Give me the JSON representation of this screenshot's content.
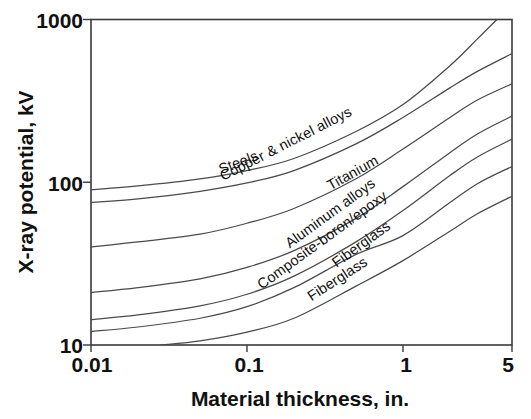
{
  "chart_data": {
    "type": "line",
    "title": "",
    "xlabel": "Material thickness, in.",
    "ylabel": "X-ray potential, kV",
    "xscale": "log",
    "yscale": "log",
    "xlim": [
      0.01,
      5
    ],
    "ylim": [
      10,
      1000
    ],
    "grid": false,
    "legend_position": "inline-on-curve",
    "xticks": [
      "0.01",
      "0.1",
      "1",
      "5"
    ],
    "xtick_values": [
      0.01,
      0.1,
      1,
      5
    ],
    "yticks": [
      "10",
      "100",
      "1000"
    ],
    "ytick_values": [
      10,
      100,
      1000
    ],
    "series": [
      {
        "name": "Copper & nickel alloys",
        "label": "Copper & nickel alloys",
        "x": [
          0.01,
          0.02,
          0.05,
          0.1,
          0.2,
          0.5,
          1.0,
          2.0,
          3.0,
          4.0
        ],
        "y": [
          90,
          95,
          105,
          118,
          140,
          205,
          300,
          520,
          760,
          1000
        ]
      },
      {
        "name": "Steels",
        "label": "Steels",
        "x": [
          0.01,
          0.02,
          0.05,
          0.1,
          0.2,
          0.5,
          1.0,
          2.0,
          3.0,
          5.0
        ],
        "y": [
          75,
          79,
          88,
          99,
          118,
          172,
          250,
          380,
          480,
          617
        ]
      },
      {
        "name": "Titanium",
        "label": "Titanium",
        "x": [
          0.01,
          0.02,
          0.05,
          0.1,
          0.2,
          0.5,
          1.0,
          2.0,
          3.0,
          5.0
        ],
        "y": [
          40,
          43,
          48,
          56,
          69,
          105,
          160,
          250,
          320,
          403
        ]
      },
      {
        "name": "Aluminum alloys",
        "label": "Aluminum alloys",
        "x": [
          0.01,
          0.02,
          0.05,
          0.1,
          0.2,
          0.5,
          1.0,
          2.0,
          3.0,
          5.0
        ],
        "y": [
          21,
          22.5,
          25.5,
          30,
          38,
          60,
          94,
          152,
          198,
          255
        ]
      },
      {
        "name": "Composite-boron/epoxy",
        "label": "Composite-boron/epoxy",
        "x": [
          0.01,
          0.02,
          0.05,
          0.1,
          0.2,
          0.5,
          1.0,
          2.0,
          3.0,
          5.0
        ],
        "y": [
          14.3,
          15.3,
          17.4,
          20.5,
          26.5,
          43,
          67,
          110,
          143,
          184
        ]
      },
      {
        "name": "Fiberglass (upper)",
        "label": "Fiberglass",
        "x": [
          0.01,
          0.02,
          0.05,
          0.1,
          0.2,
          0.5,
          1.0,
          2.0,
          3.0,
          5.0
        ],
        "y": [
          12.1,
          12.9,
          14.6,
          17.2,
          22.5,
          36,
          47,
          75,
          98,
          125
        ]
      },
      {
        "name": "Fiberglass (lower)",
        "label": "Fiberglass",
        "x": [
          0.028,
          0.05,
          0.1,
          0.2,
          0.5,
          1.0,
          2.0,
          3.0,
          5.0
        ],
        "y": [
          10,
          10.6,
          12.0,
          14.6,
          23,
          33,
          50,
          64,
          82
        ]
      }
    ],
    "curve_labels": [
      {
        "text": "Copper & nickel alloys",
        "x": 288,
        "y": 148,
        "angle": -27
      },
      {
        "text": "Steels",
        "x": 240,
        "y": 167,
        "angle": -21
      },
      {
        "text": "Titanium",
        "x": 355,
        "y": 177,
        "angle": -29
      },
      {
        "text": "Aluminum alloys",
        "x": 333,
        "y": 217,
        "angle": -36
      },
      {
        "text": "Composite-boron/epoxy",
        "x": 325,
        "y": 244,
        "angle": -36
      },
      {
        "text": "Fiberglass",
        "x": 364,
        "y": 248,
        "angle": -36
      },
      {
        "text": "Fiberglass",
        "x": 340,
        "y": 283,
        "angle": -33
      }
    ]
  },
  "axes": {
    "y_title": "X-ray potential, kV",
    "x_title": "Material thickness, in.",
    "y_labels": [
      "1000",
      "100",
      "10"
    ],
    "x_labels": [
      "0.01",
      "0.1",
      "1",
      "5"
    ]
  },
  "colors": {
    "curve": "#4a4a4a",
    "frame": "#3a3a3a",
    "text": "#111111",
    "background": "#ffffff"
  }
}
